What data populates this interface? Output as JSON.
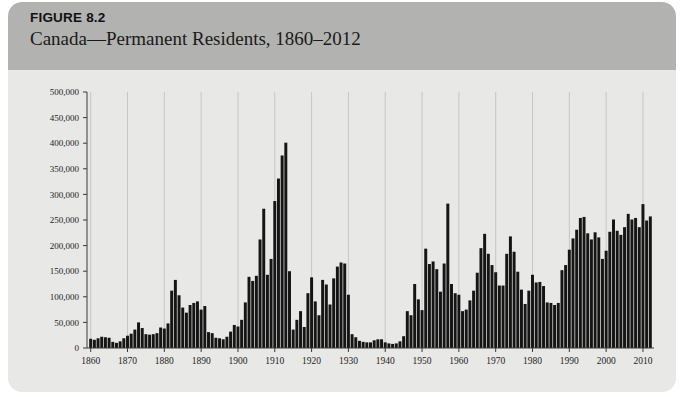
{
  "figure": {
    "label": "FIGURE 8.2",
    "title": "Canada—Permanent Residents, 1860–2012"
  },
  "colors": {
    "header_band": "#b2b2b0",
    "card_background": "#e8e8e6",
    "bar": "#151515",
    "axis": "#3a3a3a",
    "gridline": "#b8b8b6"
  },
  "chart_data": {
    "type": "bar",
    "title": "Canada—Permanent Residents, 1860–2012",
    "xlabel": "",
    "ylabel": "",
    "xlim": [
      1859,
      2013
    ],
    "ylim": [
      0,
      500000
    ],
    "ytick_labels": [
      "0",
      "50,000",
      "100,000",
      "150,000",
      "200,000",
      "250,000",
      "300,000",
      "350,000",
      "400,000",
      "450,000",
      "500,000"
    ],
    "ytick_values": [
      0,
      50000,
      100000,
      150000,
      200000,
      250000,
      300000,
      350000,
      400000,
      450000,
      500000
    ],
    "xtick_labels": [
      "1860",
      "1870",
      "1880",
      "1890",
      "1900",
      "1910",
      "1920",
      "1930",
      "1940",
      "1950",
      "1960",
      "1970",
      "1980",
      "1990",
      "2000",
      "2010"
    ],
    "xtick_values": [
      1860,
      1870,
      1880,
      1890,
      1900,
      1910,
      1920,
      1930,
      1940,
      1950,
      1960,
      1970,
      1980,
      1990,
      2000,
      2010
    ],
    "grid": "vertical-only",
    "legend": "none",
    "categories": [
      1860,
      1861,
      1862,
      1863,
      1864,
      1865,
      1866,
      1867,
      1868,
      1869,
      1870,
      1871,
      1872,
      1873,
      1874,
      1875,
      1876,
      1877,
      1878,
      1879,
      1880,
      1881,
      1882,
      1883,
      1884,
      1885,
      1886,
      1887,
      1888,
      1889,
      1890,
      1891,
      1892,
      1893,
      1894,
      1895,
      1896,
      1897,
      1898,
      1899,
      1900,
      1901,
      1902,
      1903,
      1904,
      1905,
      1906,
      1907,
      1908,
      1909,
      1910,
      1911,
      1912,
      1913,
      1914,
      1915,
      1916,
      1917,
      1918,
      1919,
      1920,
      1921,
      1922,
      1923,
      1924,
      1925,
      1926,
      1927,
      1928,
      1929,
      1930,
      1931,
      1932,
      1933,
      1934,
      1935,
      1936,
      1937,
      1938,
      1939,
      1940,
      1941,
      1942,
      1943,
      1944,
      1945,
      1946,
      1947,
      1948,
      1949,
      1950,
      1951,
      1952,
      1953,
      1954,
      1955,
      1956,
      1957,
      1958,
      1959,
      1960,
      1961,
      1962,
      1963,
      1964,
      1965,
      1966,
      1967,
      1968,
      1969,
      1970,
      1971,
      1972,
      1973,
      1974,
      1975,
      1976,
      1977,
      1978,
      1979,
      1980,
      1981,
      1982,
      1983,
      1984,
      1985,
      1986,
      1987,
      1988,
      1989,
      1990,
      1991,
      1992,
      1993,
      1994,
      1995,
      1996,
      1997,
      1998,
      1999,
      2000,
      2001,
      2002,
      2003,
      2004,
      2005,
      2006,
      2007,
      2008,
      2009,
      2010,
      2011,
      2012
    ],
    "values": [
      18000,
      16000,
      19000,
      22000,
      21000,
      20000,
      12000,
      10000,
      13000,
      19000,
      24000,
      28000,
      36000,
      50000,
      39000,
      27000,
      26000,
      27000,
      29000,
      40000,
      38000,
      48000,
      112000,
      133000,
      103000,
      79000,
      69000,
      84000,
      88000,
      91000,
      75000,
      82000,
      31000,
      29000,
      20000,
      19000,
      17000,
      22000,
      32000,
      45000,
      42000,
      55000,
      89000,
      139000,
      131000,
      141000,
      212000,
      272000,
      143000,
      174000,
      287000,
      331000,
      376000,
      401000,
      150000,
      36000,
      55000,
      72000,
      41000,
      107000,
      138000,
      91000,
      64000,
      133000,
      124000,
      85000,
      136000,
      159000,
      167000,
      165000,
      104000,
      27000,
      21000,
      14000,
      12000,
      11000,
      11000,
      15000,
      17000,
      17000,
      11000,
      9000,
      8000,
      9000,
      13000,
      23000,
      72000,
      64000,
      125000,
      95000,
      74000,
      194000,
      164000,
      169000,
      154000,
      110000,
      165000,
      282000,
      125000,
      107000,
      104000,
      72000,
      75000,
      93000,
      112000,
      147000,
      195000,
      223000,
      184000,
      162000,
      148000,
      122000,
      122000,
      184000,
      218000,
      188000,
      149000,
      114000,
      86000,
      112000,
      143000,
      128000,
      129000,
      121000,
      89000,
      88000,
      84000,
      88000,
      152000,
      162000,
      192000,
      214000,
      231000,
      254000,
      256000,
      224000,
      212000,
      226000,
      216000,
      174000,
      190000,
      227000,
      251000,
      229000,
      221000,
      236000,
      262000,
      251000,
      254000,
      236000,
      281000,
      249000,
      257000
    ]
  }
}
